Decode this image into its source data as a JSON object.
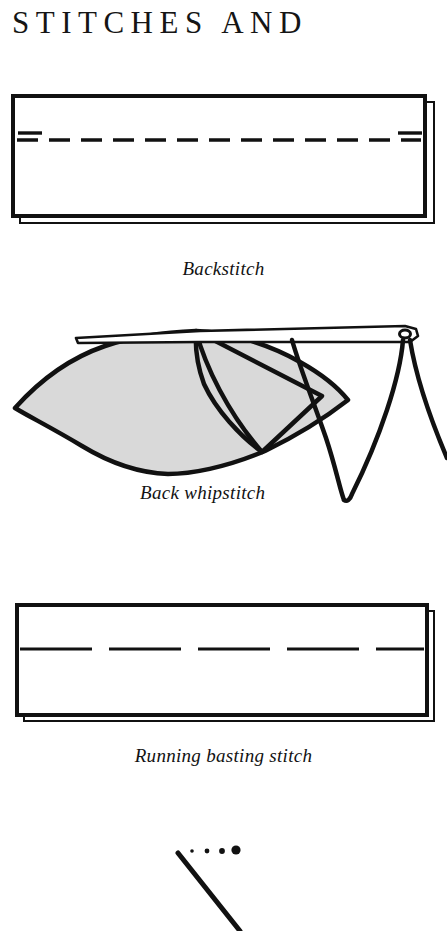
{
  "page": {
    "title": "STITCHES AND",
    "background_color": "#ffffff",
    "ink_color": "#111111",
    "fabric_fill": "#d9d9d9"
  },
  "figures": [
    {
      "id": "backstitch",
      "caption": "Backstitch",
      "kind": "fabric-panel-with-stitch-line",
      "stitch_style": "dashed-short-with-doubled-end-dashes",
      "description": "Rectangular fabric panel with drop shadow and a horizontal dashed backstitch line"
    },
    {
      "id": "whipstitch",
      "caption": "Back  whipstitch",
      "kind": "folded-fabric-with-needle-and-thread",
      "description": "Shaded lens shaped folded fabric, needle passing horizontally with thread looping below"
    },
    {
      "id": "running",
      "caption": "Running basting stitch",
      "kind": "fabric-panel-with-stitch-line",
      "stitch_style": "long-dashes-wide-gaps",
      "description": "Rectangular fabric panel with drop shadow and a horizontal long dashed basting line"
    },
    {
      "id": "partial",
      "caption": "",
      "kind": "partial-diagram",
      "description": "Top of the next illustration: a diagonal stroke with four dots of increasing size"
    }
  ]
}
